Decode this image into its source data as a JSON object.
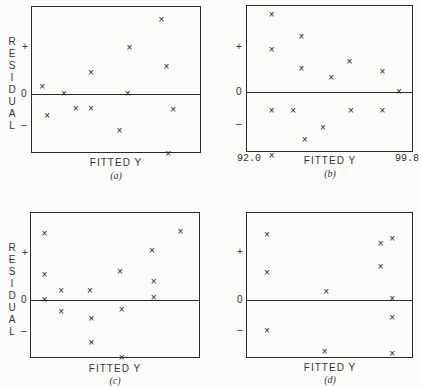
{
  "chart_data": [
    {
      "type": "scatter",
      "panel": "a",
      "caption": "(a)",
      "xlabel": "FITTED Y",
      "ylabel": "RESIDUAL",
      "yticks": [
        "+",
        "0",
        "–"
      ],
      "zero_line": true,
      "points": [
        {
          "x": 0.06,
          "y": 0.17
        },
        {
          "x": 0.09,
          "y": -0.47
        },
        {
          "x": 0.19,
          "y": 0.0
        },
        {
          "x": 0.26,
          "y": -0.32
        },
        {
          "x": 0.35,
          "y": 0.47
        },
        {
          "x": 0.35,
          "y": -0.32
        },
        {
          "x": 0.52,
          "y": -0.79
        },
        {
          "x": 0.57,
          "y": 0.0
        },
        {
          "x": 0.58,
          "y": 1.02
        },
        {
          "x": 0.77,
          "y": 1.62
        },
        {
          "x": 0.8,
          "y": 0.6
        },
        {
          "x": 0.81,
          "y": -1.3
        },
        {
          "x": 0.84,
          "y": -0.34
        }
      ]
    },
    {
      "type": "scatter",
      "panel": "b",
      "caption": "(b)",
      "xlabel": "FITTED Y",
      "xtick_min": "92.0",
      "xtick_max": "99.8",
      "yticks": [
        "+",
        "0",
        "–"
      ],
      "zero_line": true,
      "points": [
        {
          "x": 0.15,
          "y": 1.77
        },
        {
          "x": 0.15,
          "y": 0.97
        },
        {
          "x": 0.15,
          "y": -0.42
        },
        {
          "x": 0.15,
          "y": -1.47
        },
        {
          "x": 0.28,
          "y": -0.42
        },
        {
          "x": 0.33,
          "y": 1.27
        },
        {
          "x": 0.33,
          "y": 0.53
        },
        {
          "x": 0.35,
          "y": -1.1
        },
        {
          "x": 0.46,
          "y": -0.83
        },
        {
          "x": 0.51,
          "y": 0.33
        },
        {
          "x": 0.62,
          "y": 0.69
        },
        {
          "x": 0.63,
          "y": -0.42
        },
        {
          "x": 0.82,
          "y": 0.47
        },
        {
          "x": 0.82,
          "y": -0.42
        },
        {
          "x": 0.92,
          "y": 0.0
        }
      ]
    },
    {
      "type": "scatter",
      "panel": "c",
      "caption": "(c)",
      "xlabel": "FITTED Y",
      "ylabel": "RESIDUAL",
      "yticks": [
        "+",
        "0",
        "–"
      ],
      "zero_line": true,
      "points": [
        {
          "x": 0.08,
          "y": 1.47
        },
        {
          "x": 0.08,
          "y": 0.56
        },
        {
          "x": 0.08,
          "y": 0.0
        },
        {
          "x": 0.18,
          "y": 0.2
        },
        {
          "x": 0.18,
          "y": -0.27
        },
        {
          "x": 0.35,
          "y": 0.2
        },
        {
          "x": 0.36,
          "y": -0.43
        },
        {
          "x": 0.36,
          "y": -0.96
        },
        {
          "x": 0.53,
          "y": 0.63
        },
        {
          "x": 0.54,
          "y": -0.23
        },
        {
          "x": 0.54,
          "y": -1.3
        },
        {
          "x": 0.72,
          "y": 1.1
        },
        {
          "x": 0.73,
          "y": 0.4
        },
        {
          "x": 0.73,
          "y": 0.03
        },
        {
          "x": 0.89,
          "y": 1.53
        }
      ]
    },
    {
      "type": "scatter",
      "panel": "d",
      "caption": "(d)",
      "xlabel": "FITTED Y",
      "yticks": [
        "+",
        "0",
        "–"
      ],
      "zero_line": true,
      "points": [
        {
          "x": 0.12,
          "y": 1.53
        },
        {
          "x": 0.12,
          "y": 0.63
        },
        {
          "x": 0.12,
          "y": -0.73
        },
        {
          "x": 0.48,
          "y": 0.2
        },
        {
          "x": 0.47,
          "y": -1.23
        },
        {
          "x": 0.81,
          "y": 1.33
        },
        {
          "x": 0.81,
          "y": 0.77
        },
        {
          "x": 0.88,
          "y": 1.43
        },
        {
          "x": 0.88,
          "y": 0.03
        },
        {
          "x": 0.88,
          "y": -0.43
        },
        {
          "x": 0.88,
          "y": -1.27
        }
      ]
    }
  ],
  "labels": {
    "residual_letters": [
      "R",
      "E",
      "S",
      "I",
      "D",
      "U",
      "A",
      "L"
    ],
    "plus": "+",
    "zero": "0",
    "minus": "–",
    "fitted_y": "FITTED Y",
    "cap_a": "(a)",
    "cap_b": "(b)",
    "cap_c": "(c)",
    "cap_d": "(d)",
    "b_xmin": "92.0",
    "b_xmax": "99.8",
    "marker": "×"
  }
}
